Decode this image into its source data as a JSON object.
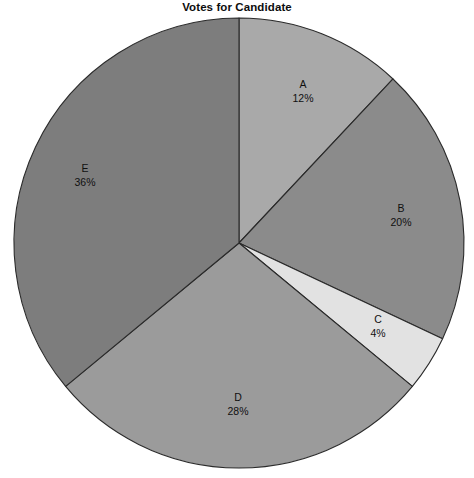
{
  "chart_data": {
    "type": "pie",
    "title": "Votes for Candidate",
    "xlabel": "",
    "ylabel": "",
    "categories": [
      "A",
      "B",
      "C",
      "D",
      "E"
    ],
    "values": [
      12,
      20,
      4,
      28,
      36
    ],
    "value_labels": [
      "12%",
      "20%",
      "4%",
      "28%",
      "36%"
    ],
    "units": "percent",
    "total": 100,
    "start_angle_deg": 90,
    "direction": "clockwise",
    "grid": false,
    "legend": "none",
    "labels_position": "inside-slice",
    "slice_colors": [
      "#a9a9a9",
      "#8b8b8b",
      "#e2e2e2",
      "#9b9b9b",
      "#7d7d7d"
    ],
    "outline_color": "#2a2a2a",
    "background_color": "#ffffff",
    "slices": [
      {
        "category": "A",
        "value": 12,
        "value_label": "12%",
        "color": "#a9a9a9",
        "label_x": 303,
        "label_y": 91
      },
      {
        "category": "B",
        "value": 20,
        "value_label": "20%",
        "color": "#8b8b8b",
        "label_x": 401,
        "label_y": 215
      },
      {
        "category": "C",
        "value": 4,
        "value_label": "4%",
        "color": "#e2e2e2",
        "label_x": 378,
        "label_y": 326
      },
      {
        "category": "D",
        "value": 28,
        "value_label": "28%",
        "color": "#9b9b9b",
        "label_x": 238,
        "label_y": 404
      },
      {
        "category": "E",
        "value": 36,
        "value_label": "36%",
        "color": "#7d7d7d",
        "label_x": 85,
        "label_y": 175
      }
    ],
    "geometry": {
      "center_x": 239,
      "center_y": 243,
      "radius": 225
    }
  }
}
